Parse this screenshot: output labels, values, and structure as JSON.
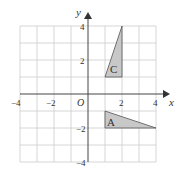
{
  "diagram": {
    "axes": {
      "x_label": "x",
      "y_label": "y",
      "origin_label": "O"
    },
    "x_ticks": [
      "−4",
      "−2",
      "2",
      "4"
    ],
    "y_ticks": [
      "4",
      "2",
      "−2",
      "−4"
    ],
    "range": {
      "x": [
        -4,
        4
      ],
      "y": [
        -4,
        4
      ]
    },
    "shapes": [
      {
        "label": "C",
        "vertices": [
          [
            1,
            1
          ],
          [
            2,
            1
          ],
          [
            2,
            4
          ]
        ],
        "fill": "#c8c8c8"
      },
      {
        "label": "A",
        "vertices": [
          [
            1,
            -1
          ],
          [
            1,
            -2
          ],
          [
            4,
            -2
          ]
        ],
        "fill": "#c8c8c8"
      }
    ]
  }
}
